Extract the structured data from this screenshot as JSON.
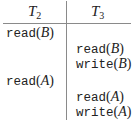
{
  "headers": [
    {
      "name": "T",
      "sub": "2"
    },
    {
      "name": "T",
      "sub": "3"
    }
  ],
  "rows": [
    {
      "column": "T2",
      "op": "read",
      "item": "B"
    },
    {
      "column": "T3",
      "op": "read",
      "item": "B"
    },
    {
      "column": "T3",
      "op": "write",
      "item": "B"
    },
    {
      "column": "T2",
      "op": "read",
      "item": "A"
    },
    {
      "column": "T3",
      "op": "read",
      "item": "A"
    },
    {
      "column": "T3",
      "op": "write",
      "item": "A"
    }
  ]
}
